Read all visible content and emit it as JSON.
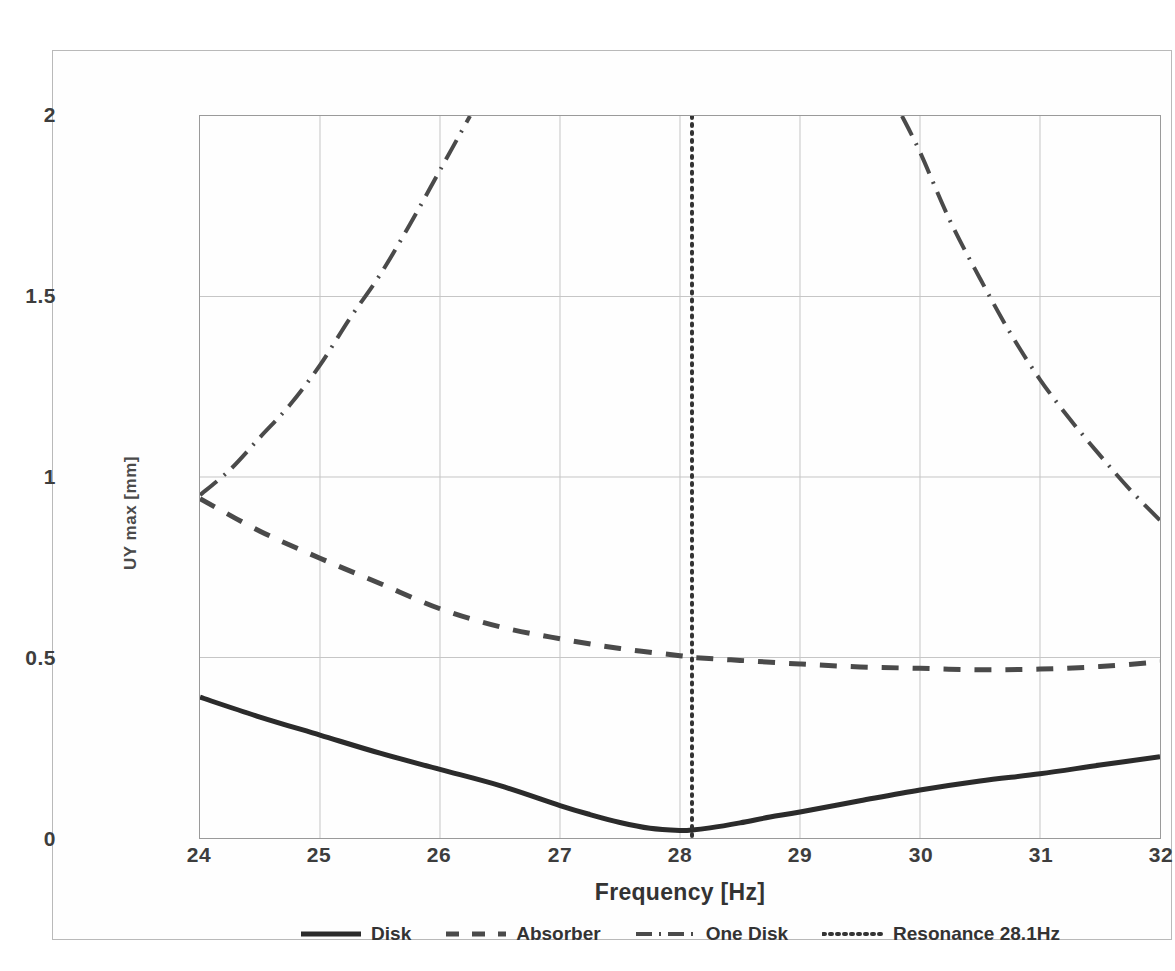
{
  "chart_data": {
    "type": "line",
    "title": "",
    "xlabel": "Frequency [Hz]",
    "ylabel": "UY max [mm]",
    "xlim": [
      24,
      32
    ],
    "ylim": [
      0,
      2
    ],
    "xticks": [
      "24",
      "25",
      "26",
      "27",
      "28",
      "29",
      "30",
      "31",
      "32"
    ],
    "yticks": [
      "0",
      "0.5",
      "1",
      "1.5",
      "2"
    ],
    "grid": true,
    "legend_position": "bottom",
    "series": [
      {
        "name": "Disk",
        "style": "solid",
        "color": "#2b2b2b",
        "x": [
          24.0,
          24.5,
          25.0,
          25.5,
          26.0,
          26.5,
          27.0,
          27.25,
          27.5,
          27.75,
          28.0,
          28.1,
          28.25,
          28.5,
          28.75,
          29.0,
          29.5,
          30.0,
          30.5,
          31.0,
          31.5,
          32.0
        ],
        "y": [
          0.39,
          0.335,
          0.285,
          0.235,
          0.19,
          0.145,
          0.09,
          0.065,
          0.043,
          0.027,
          0.021,
          0.022,
          0.028,
          0.042,
          0.058,
          0.072,
          0.103,
          0.133,
          0.158,
          0.178,
          0.202,
          0.225
        ]
      },
      {
        "name": "Absorber",
        "style": "dashed",
        "color": "#4a4a4a",
        "x": [
          24.0,
          24.5,
          25.0,
          25.5,
          26.0,
          26.5,
          27.0,
          27.5,
          28.0,
          28.1,
          28.5,
          29.0,
          29.5,
          30.0,
          30.5,
          31.0,
          31.5,
          32.0
        ],
        "y": [
          0.94,
          0.85,
          0.775,
          0.705,
          0.635,
          0.585,
          0.552,
          0.525,
          0.505,
          0.5,
          0.492,
          0.482,
          0.474,
          0.47,
          0.466,
          0.468,
          0.475,
          0.488
        ]
      },
      {
        "name": "One Disk",
        "style": "dashdot",
        "color": "#4a4a4a",
        "branches": [
          {
            "x": [
              24.0,
              24.25,
              24.5,
              24.75,
              25.0,
              25.25,
              25.5,
              25.75,
              26.0,
              26.25
            ],
            "y": [
              0.95,
              1.02,
              1.11,
              1.2,
              1.31,
              1.44,
              1.56,
              1.7,
              1.85,
              2.0
            ]
          },
          {
            "x": [
              29.85,
              30.0,
              30.25,
              30.5,
              30.75,
              31.0,
              31.25,
              31.5,
              31.75,
              32.0
            ],
            "y": [
              2.0,
              1.9,
              1.71,
              1.55,
              1.4,
              1.27,
              1.16,
              1.06,
              0.965,
              0.88
            ]
          }
        ]
      },
      {
        "name": "Resonance 28.1Hz",
        "style": "dotted",
        "color": "#333333",
        "vertical_line_x": 28.1
      }
    ]
  },
  "axes": {
    "x_label": "Frequency [Hz]",
    "y_label": "UY max [mm]",
    "x_ticks": [
      "24",
      "25",
      "26",
      "27",
      "28",
      "29",
      "30",
      "31",
      "32"
    ],
    "y_ticks": [
      "2",
      "1.5",
      "1",
      "0.5",
      "0"
    ]
  },
  "legend": {
    "items": [
      {
        "label": "Disk",
        "style": "solid"
      },
      {
        "label": "Absorber",
        "style": "dashed"
      },
      {
        "label": "One Disk",
        "style": "dashdot"
      },
      {
        "label": "Resonance 28.1Hz",
        "style": "dotted"
      }
    ]
  },
  "caption": {
    "text": ""
  },
  "colors": {
    "series_dark": "#2b2b2b",
    "series_gray": "#4a4a4a",
    "grid": "#c6c6c6",
    "axis": "#9a9a9a",
    "frame": "#b9b9b9"
  }
}
